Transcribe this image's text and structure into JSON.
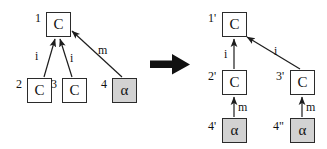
{
  "figure": {
    "type": "graph-rewrite-diagram",
    "colors": {
      "stroke": "#2b2b2b",
      "shaded_node_fill": "#d2d2d2",
      "plain_node_fill": "#ffffff",
      "text": "#111111",
      "background": "#ffffff",
      "big_arrow": "#111111"
    }
  },
  "left_graph": {
    "name": "left-hand-side",
    "nodes": [
      {
        "id": "1",
        "label": "C",
        "shaded": false,
        "x": 46,
        "y": 12,
        "w": 25,
        "h": 25,
        "id_x": 35,
        "id_y": 12
      },
      {
        "id": "2",
        "label": "C",
        "shaded": false,
        "x": 27,
        "y": 78,
        "w": 25,
        "h": 25,
        "id_x": 16,
        "id_y": 78
      },
      {
        "id": "3",
        "label": "C",
        "shaded": false,
        "x": 62,
        "y": 78,
        "w": 25,
        "h": 25,
        "id_x": 51,
        "id_y": 78
      },
      {
        "id": "4",
        "label": "α",
        "shaded": true,
        "x": 112,
        "y": 78,
        "w": 25,
        "h": 25,
        "id_x": 101,
        "id_y": 78
      }
    ],
    "edges": [
      {
        "label": "i",
        "from": "2",
        "to": "1",
        "x1": 44,
        "y1": 77,
        "x2": 55,
        "y2": 39,
        "lx": 35,
        "ly": 50
      },
      {
        "label": "i",
        "from": "3",
        "to": "1",
        "x1": 72,
        "y1": 77,
        "x2": 60,
        "y2": 39,
        "lx": 70,
        "ly": 52
      },
      {
        "label": "m",
        "from": "4",
        "to": "1",
        "x1": 122,
        "y1": 77,
        "x2": 72,
        "y2": 31,
        "lx": 98,
        "ly": 44
      }
    ]
  },
  "transform_arrow": {
    "name": "rewrite-arrow",
    "x": 150,
    "y": 53,
    "w": 40,
    "h": 22
  },
  "right_graph": {
    "name": "right-hand-side",
    "nodes": [
      {
        "id": "1'",
        "label": "C",
        "shaded": false,
        "x": 222,
        "y": 12,
        "w": 25,
        "h": 25,
        "id_x": 208,
        "id_y": 12
      },
      {
        "id": "2'",
        "label": "C",
        "shaded": false,
        "x": 222,
        "y": 70,
        "w": 25,
        "h": 25,
        "id_x": 208,
        "id_y": 70
      },
      {
        "id": "3'",
        "label": "C",
        "shaded": false,
        "x": 290,
        "y": 70,
        "w": 25,
        "h": 25,
        "id_x": 276,
        "id_y": 70
      },
      {
        "id": "4'",
        "label": "α",
        "shaded": true,
        "x": 222,
        "y": 118,
        "w": 25,
        "h": 25,
        "id_x": 208,
        "id_y": 120
      },
      {
        "id": "4\"",
        "label": "α",
        "shaded": true,
        "x": 290,
        "y": 118,
        "w": 25,
        "h": 25,
        "id_x": 273,
        "id_y": 120
      }
    ],
    "edges": [
      {
        "label": "i",
        "from": "2'",
        "to": "1'",
        "x1": 234,
        "y1": 69,
        "x2": 234,
        "y2": 39,
        "lx": 224,
        "ly": 48
      },
      {
        "label": "i",
        "from": "3'",
        "to": "1'",
        "x1": 300,
        "y1": 69,
        "x2": 247,
        "y2": 37,
        "lx": 274,
        "ly": 45
      },
      {
        "label": "m",
        "from": "4'",
        "to": "2'",
        "x1": 234,
        "y1": 117,
        "x2": 234,
        "y2": 97,
        "lx": 238,
        "ly": 101
      },
      {
        "label": "m",
        "from": "4\"",
        "to": "3'",
        "x1": 302,
        "y1": 117,
        "x2": 302,
        "y2": 97,
        "lx": 306,
        "ly": 101
      }
    ]
  }
}
